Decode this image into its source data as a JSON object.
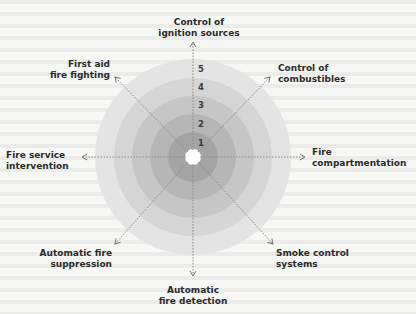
{
  "diagram": {
    "title": "",
    "center": "center",
    "rings": [
      "1",
      "2",
      "3",
      "4",
      "5"
    ],
    "ring_colors": [
      "#a4a4a4",
      "#b6b6b6",
      "#c6c6c6",
      "#d5d5d5",
      "#e4e4e4"
    ],
    "axes": [
      {
        "id": "top",
        "line1": "Control of",
        "line2": "ignition sources"
      },
      {
        "id": "top-right",
        "line1": "Control of",
        "line2": "combustibles"
      },
      {
        "id": "right",
        "line1": "Fire",
        "line2": "compartmentation"
      },
      {
        "id": "bottom-right",
        "line1": "Smoke control",
        "line2": "systems"
      },
      {
        "id": "bottom",
        "line1": "Automatic",
        "line2": "fire detection"
      },
      {
        "id": "bottom-left",
        "line1": "Automatic fire",
        "line2": "suppression"
      },
      {
        "id": "left",
        "line1": "Fire service",
        "line2": "intervention"
      },
      {
        "id": "top-left",
        "line1": "First aid",
        "line2": "fire fighting"
      }
    ]
  }
}
